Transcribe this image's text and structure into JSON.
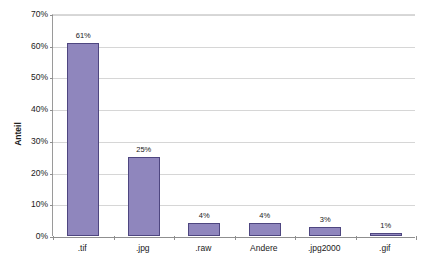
{
  "chart_data": {
    "type": "bar",
    "title": "Dateiformat",
    "xlabel": "",
    "ylabel": "Anteil",
    "categories": [
      ".tif",
      ".jpg",
      ".raw",
      "Andere",
      ".jpg2000",
      ".gif"
    ],
    "values": [
      61,
      25,
      4,
      4,
      3,
      1
    ],
    "value_labels": [
      "61%",
      "25%",
      "4%",
      "4%",
      "3%",
      "1%"
    ],
    "ylim": [
      0,
      70
    ],
    "ytick_labels": [
      "0%",
      "10%",
      "20%",
      "30%",
      "40%",
      "50%",
      "60%",
      "70%"
    ],
    "ytick_values": [
      0,
      10,
      20,
      30,
      40,
      50,
      60,
      70
    ],
    "grid": true,
    "legend": false,
    "bar_color": "#8f86bd",
    "bar_border_color": "#4e4680",
    "grid_color": "#d6d6d6",
    "axis_color": "#8f8f8f"
  }
}
